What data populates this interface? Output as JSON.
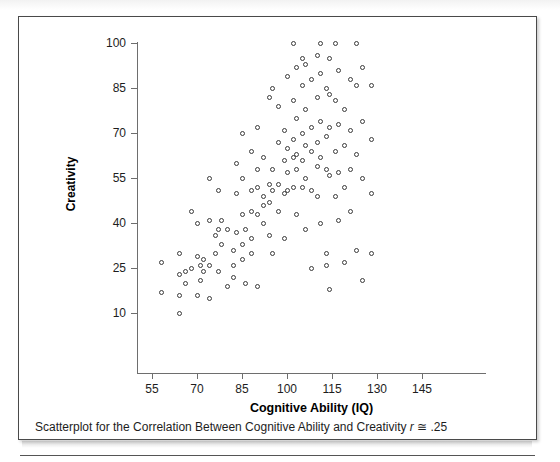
{
  "figure": {
    "caption_text": "Scatterplot for the Correlation Between Cognitive Ability and Creativity ",
    "caption_r": "r",
    "caption_approx": " ≅ ",
    "caption_value": ".25"
  },
  "chart_data": {
    "type": "scatter",
    "title": "",
    "xlabel": "Cognitive Ability (IQ)",
    "ylabel": "Creativity",
    "xticks": [
      55,
      70,
      85,
      100,
      115,
      130,
      145
    ],
    "yticks": [
      10,
      25,
      40,
      55,
      70,
      85,
      100
    ],
    "xlim": [
      49,
      164
    ],
    "ylim": [
      0,
      103
    ],
    "grid": false,
    "legend": null,
    "marker": "open-circle",
    "marker_color": "#3a3a3a",
    "correlation_label": "r ≅ .25",
    "points": [
      [
        58,
        27
      ],
      [
        58,
        17
      ],
      [
        64,
        30
      ],
      [
        64,
        23
      ],
      [
        64,
        16
      ],
      [
        64,
        10
      ],
      [
        66,
        24
      ],
      [
        66,
        20
      ],
      [
        68,
        44
      ],
      [
        68,
        25
      ],
      [
        70,
        40
      ],
      [
        70,
        29
      ],
      [
        70,
        16
      ],
      [
        71,
        26
      ],
      [
        71,
        21
      ],
      [
        72,
        28
      ],
      [
        72,
        24
      ],
      [
        74,
        41
      ],
      [
        74,
        55
      ],
      [
        74,
        26
      ],
      [
        74,
        15
      ],
      [
        76,
        36
      ],
      [
        76,
        30
      ],
      [
        77,
        51
      ],
      [
        77,
        38
      ],
      [
        77,
        24
      ],
      [
        78,
        41
      ],
      [
        78,
        33
      ],
      [
        80,
        38
      ],
      [
        80,
        19
      ],
      [
        82,
        31
      ],
      [
        82,
        26
      ],
      [
        82,
        22
      ],
      [
        83,
        60
      ],
      [
        83,
        37
      ],
      [
        83,
        50
      ],
      [
        85,
        70
      ],
      [
        85,
        55
      ],
      [
        85,
        43
      ],
      [
        85,
        33
      ],
      [
        85,
        28
      ],
      [
        86,
        38
      ],
      [
        86,
        20
      ],
      [
        88,
        51
      ],
      [
        88,
        64
      ],
      [
        88,
        44
      ],
      [
        88,
        35
      ],
      [
        88,
        30
      ],
      [
        90,
        72
      ],
      [
        90,
        58
      ],
      [
        90,
        52
      ],
      [
        90,
        43
      ],
      [
        90,
        19
      ],
      [
        92,
        62
      ],
      [
        92,
        49
      ],
      [
        92,
        46
      ],
      [
        92,
        40
      ],
      [
        94,
        82
      ],
      [
        94,
        53
      ],
      [
        94,
        47
      ],
      [
        94,
        36
      ],
      [
        95,
        85
      ],
      [
        95,
        58
      ],
      [
        95,
        51
      ],
      [
        95,
        30
      ],
      [
        97,
        79
      ],
      [
        97,
        67
      ],
      [
        97,
        53
      ],
      [
        97,
        44
      ],
      [
        99,
        71
      ],
      [
        99,
        61
      ],
      [
        99,
        50
      ],
      [
        99,
        35
      ],
      [
        100,
        89
      ],
      [
        100,
        65
      ],
      [
        100,
        57
      ],
      [
        100,
        51
      ],
      [
        102,
        100
      ],
      [
        102,
        81
      ],
      [
        102,
        68
      ],
      [
        102,
        62
      ],
      [
        102,
        52
      ],
      [
        103,
        92
      ],
      [
        103,
        75
      ],
      [
        103,
        63
      ],
      [
        103,
        58
      ],
      [
        103,
        43
      ],
      [
        105,
        95
      ],
      [
        105,
        86
      ],
      [
        105,
        70
      ],
      [
        105,
        61
      ],
      [
        105,
        52
      ],
      [
        106,
        93
      ],
      [
        106,
        78
      ],
      [
        106,
        66
      ],
      [
        106,
        55
      ],
      [
        106,
        38
      ],
      [
        108,
        88
      ],
      [
        108,
        72
      ],
      [
        108,
        64
      ],
      [
        108,
        51
      ],
      [
        108,
        25
      ],
      [
        110,
        96
      ],
      [
        110,
        82
      ],
      [
        110,
        67
      ],
      [
        110,
        59
      ],
      [
        110,
        49
      ],
      [
        111,
        100
      ],
      [
        111,
        90
      ],
      [
        111,
        74
      ],
      [
        111,
        62
      ],
      [
        111,
        40
      ],
      [
        113,
        85
      ],
      [
        113,
        69
      ],
      [
        113,
        58
      ],
      [
        113,
        30
      ],
      [
        113,
        26
      ],
      [
        114,
        95
      ],
      [
        114,
        83
      ],
      [
        114,
        72
      ],
      [
        114,
        56
      ],
      [
        114,
        18
      ],
      [
        116,
        100
      ],
      [
        116,
        81
      ],
      [
        116,
        64
      ],
      [
        116,
        49
      ],
      [
        117,
        91
      ],
      [
        117,
        73
      ],
      [
        117,
        57
      ],
      [
        117,
        41
      ],
      [
        119,
        78
      ],
      [
        119,
        66
      ],
      [
        119,
        52
      ],
      [
        119,
        27
      ],
      [
        121,
        88
      ],
      [
        121,
        71
      ],
      [
        121,
        58
      ],
      [
        121,
        44
      ],
      [
        123,
        100
      ],
      [
        123,
        86
      ],
      [
        123,
        63
      ],
      [
        123,
        31
      ],
      [
        125,
        92
      ],
      [
        125,
        74
      ],
      [
        125,
        55
      ],
      [
        125,
        21
      ],
      [
        128,
        86
      ],
      [
        128,
        68
      ],
      [
        128,
        50
      ],
      [
        128,
        30
      ]
    ]
  }
}
